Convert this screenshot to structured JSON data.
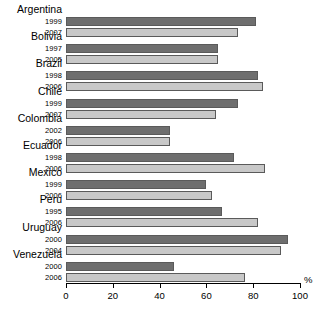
{
  "chart_data": {
    "type": "bar",
    "orientation": "horizontal",
    "title": "",
    "subtitle": "",
    "xlabel": "%",
    "ylabel": "",
    "xlim": [
      0,
      100
    ],
    "xticks": [
      0,
      20,
      40,
      60,
      80,
      100
    ],
    "xtick_labels": [
      "0",
      "20",
      "40",
      "60",
      "80",
      "100"
    ],
    "grid": false,
    "legend": "none",
    "categories": [
      "Argentina",
      "Bolivia",
      "Brazil",
      "Chile",
      "Colombia",
      "Ecuador",
      "Mexico",
      "Peru",
      "Uruguay",
      "Venezuela"
    ],
    "series": [
      {
        "name": "earlier year",
        "color": "#6e6e6e",
        "years": [
          "1999",
          "1997",
          "1998",
          "1999",
          "2002",
          "1998",
          "1999",
          "1995",
          "2000",
          "2000"
        ],
        "values": [
          81,
          65,
          82,
          73.5,
          44.5,
          72,
          60,
          66.5,
          95,
          46
        ]
      },
      {
        "name": "later year",
        "color": "#c8c8c8",
        "years": [
          "2007",
          "2005",
          "2006",
          "2007",
          "2006",
          "2006",
          "2006",
          "2006",
          "2004",
          "2006"
        ],
        "values": [
          73.5,
          65,
          84,
          64,
          44.5,
          85,
          62.5,
          82,
          92,
          76.5
        ]
      }
    ],
    "bars": [
      {
        "country": "Argentina",
        "year": "1999",
        "value": 81,
        "period": 1
      },
      {
        "country": "Argentina",
        "year": "2007",
        "value": 73.5,
        "period": 2
      },
      {
        "country": "Bolivia",
        "year": "1997",
        "value": 65,
        "period": 1
      },
      {
        "country": "Bolivia",
        "year": "2005",
        "value": 65,
        "period": 2
      },
      {
        "country": "Brazil",
        "year": "1998",
        "value": 82,
        "period": 1
      },
      {
        "country": "Brazil",
        "year": "2006",
        "value": 84,
        "period": 2
      },
      {
        "country": "Chile",
        "year": "1999",
        "value": 73.5,
        "period": 1
      },
      {
        "country": "Chile",
        "year": "2007",
        "value": 64,
        "period": 2
      },
      {
        "country": "Colombia",
        "year": "2002",
        "value": 44.5,
        "period": 1
      },
      {
        "country": "Colombia",
        "year": "2006",
        "value": 44.5,
        "period": 2
      },
      {
        "country": "Ecuador",
        "year": "1998",
        "value": 72,
        "period": 1
      },
      {
        "country": "Ecuador",
        "year": "2006",
        "value": 85,
        "period": 2
      },
      {
        "country": "Mexico",
        "year": "1999",
        "value": 60,
        "period": 1
      },
      {
        "country": "Mexico",
        "year": "2006",
        "value": 62.5,
        "period": 2
      },
      {
        "country": "Peru",
        "year": "1995",
        "value": 66.5,
        "period": 1
      },
      {
        "country": "Peru",
        "year": "2006",
        "value": 82,
        "period": 2
      },
      {
        "country": "Uruguay",
        "year": "2000",
        "value": 95,
        "period": 1
      },
      {
        "country": "Uruguay",
        "year": "2004",
        "value": 92,
        "period": 2
      },
      {
        "country": "Venezuela",
        "year": "2000",
        "value": 46,
        "period": 1
      },
      {
        "country": "Venezuela",
        "year": "2006",
        "value": 76.5,
        "period": 2
      }
    ],
    "colors": {
      "period1": "#6e6e6e",
      "period2": "#c8c8c8",
      "bar_border": "#5a5a5a",
      "axis": "#000000",
      "background": "#ffffff"
    }
  }
}
